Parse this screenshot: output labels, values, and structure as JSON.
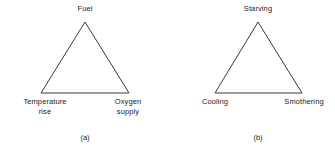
{
  "figure": {
    "background_color": "#ffffff",
    "line_color": "#3a3a3a",
    "text_color": "#1a1a1a"
  },
  "diagrams": [
    {
      "id": "fire-triangle",
      "caption": "(a)",
      "apex": {
        "label": "Fuel"
      },
      "bottom_left": {
        "line1": "Temperature",
        "line2": "rise"
      },
      "bottom_right": {
        "line1": "Oxygen",
        "line2": "supply"
      }
    },
    {
      "id": "extinguishment-triangle",
      "caption": "(b)",
      "apex": {
        "label": "Starving"
      },
      "bottom_left": {
        "line1": "Cooling",
        "line2": ""
      },
      "bottom_right": {
        "line1": "Smothering",
        "line2": ""
      }
    }
  ]
}
